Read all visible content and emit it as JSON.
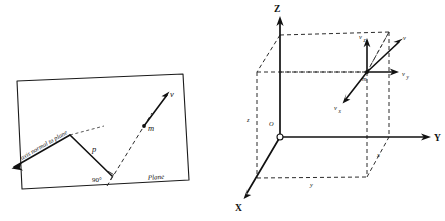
{
  "figure": {
    "panels": [
      {
        "id": "left",
        "name": "plane-normal-axis-diagram",
        "labels": {
          "axis_normal": "axis normal to plane",
          "p": "p",
          "angle": "90°",
          "m": "m",
          "v": "v",
          "plane": "Plane"
        }
      },
      {
        "id": "right",
        "name": "cartesian-velocity-components-diagram",
        "labels": {
          "axis_z": "Z",
          "axis_y": "Y",
          "axis_x": "X",
          "origin": "O",
          "dim_z": "z",
          "dim_y": "y",
          "dim_x": "x",
          "m": "m",
          "v": "v",
          "v_x": "v",
          "v_x_sub": "x",
          "v_y": "v",
          "v_y_sub": "y",
          "v_z": "v",
          "v_z_sub": "z"
        }
      }
    ],
    "colors": {
      "ink": "#111111",
      "background": "#ffffff",
      "dashed": "#2b2b2b"
    }
  }
}
